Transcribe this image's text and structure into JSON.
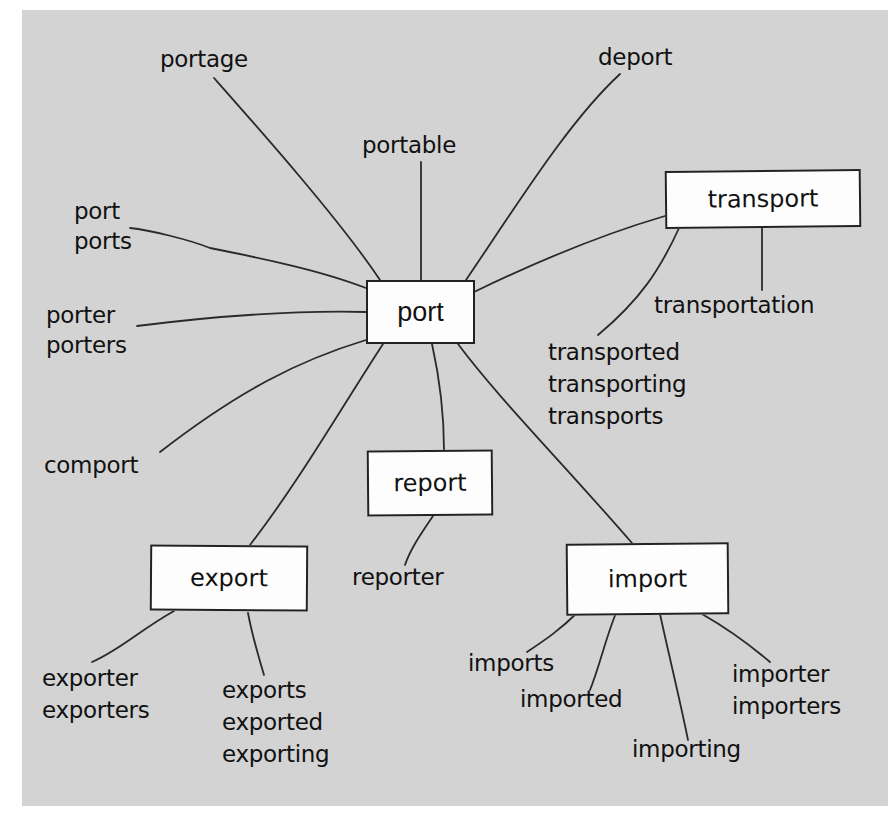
{
  "diagram": {
    "type": "word-family mind map",
    "colors": {
      "background": "#d3d3d3",
      "box_fill": "#fdfdfd",
      "line": "#222222",
      "text": "#111111"
    },
    "center": {
      "label": "port"
    },
    "boxes": {
      "transport": "transport",
      "report": "report",
      "export": "export",
      "import": "import"
    },
    "leaves": {
      "portage": "portage",
      "portable": "portable",
      "deport": "deport",
      "port_ports": "port\nports",
      "porter_porters": "porter\nporters",
      "comport": "comport",
      "transportation": "transportation",
      "transported_group": "transported\ntransporting\ntransports",
      "reporter": "reporter",
      "exporter_group": "exporter\nexporters",
      "exports_group": "exports\nexported\nexporting",
      "imports": "imports",
      "imported": "imported",
      "importing": "importing",
      "importer_group": "importer\nimporters"
    }
  }
}
